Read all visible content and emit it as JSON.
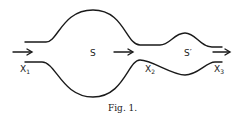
{
  "figure": {
    "caption": "Fig. 1.",
    "chambers": [
      {
        "label": "S",
        "name": "large-chamber"
      },
      {
        "label": "S′",
        "name": "small-chamber"
      }
    ],
    "positions": [
      {
        "base": "X",
        "sub": "1"
      },
      {
        "base": "X",
        "sub": "2"
      },
      {
        "base": "X",
        "sub": "3"
      }
    ],
    "flow_arrows": 3,
    "colors": {
      "ink": "#1a1a1a",
      "background": "#ffffff"
    }
  }
}
